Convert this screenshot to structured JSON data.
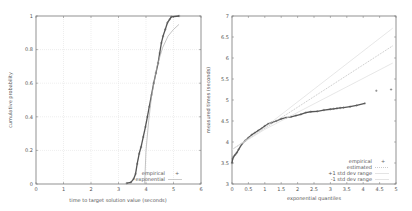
{
  "chart_data": [
    {
      "type": "line",
      "xlabel": "time to target solution value (seconds)",
      "ylabel": "cumulative probability",
      "xlim": [
        0,
        6
      ],
      "ylim": [
        0,
        1
      ],
      "xticks": [
        "0",
        "1",
        "2",
        "3",
        "4",
        "5",
        "6"
      ],
      "yticks": [
        "0",
        "0.2",
        "0.4",
        "0.6",
        "0.8",
        "1"
      ],
      "grid": true,
      "legend_position": "bottom-right",
      "series": [
        {
          "name": "empirical",
          "style": "points",
          "x": [
            3.3,
            3.45,
            3.55,
            3.62,
            3.68,
            3.75,
            3.82,
            3.9,
            3.98,
            4.05,
            4.12,
            4.2,
            4.28,
            4.36,
            4.44,
            4.5,
            4.56,
            4.62,
            4.7,
            4.78,
            4.86,
            4.92,
            5.2
          ],
          "y": [
            0.005,
            0.01,
            0.03,
            0.06,
            0.12,
            0.18,
            0.22,
            0.28,
            0.34,
            0.4,
            0.46,
            0.53,
            0.6,
            0.66,
            0.72,
            0.78,
            0.84,
            0.88,
            0.92,
            0.96,
            0.98,
            0.995,
            1.0
          ]
        },
        {
          "name": "exponential",
          "style": "line",
          "x": [
            3.95,
            4.0,
            4.1,
            4.2,
            4.4,
            4.6,
            4.8,
            5.0,
            5.2
          ],
          "y": [
            0.0,
            0.2,
            0.38,
            0.52,
            0.7,
            0.81,
            0.88,
            0.92,
            0.95
          ]
        }
      ]
    },
    {
      "type": "scatter",
      "xlabel": "exponential quantiles",
      "ylabel": "measured times (seconds)",
      "xlim": [
        0,
        5
      ],
      "ylim": [
        3,
        7
      ],
      "xticks": [
        "0",
        "0.5",
        "1",
        "1.5",
        "2",
        "2.5",
        "3",
        "3.5",
        "4",
        "4.5",
        "5"
      ],
      "yticks": [
        "3",
        "3.5",
        "4",
        "4.5",
        "5",
        "5.5",
        "6",
        "6.5",
        "7"
      ],
      "grid": false,
      "legend_position": "bottom-right",
      "series": [
        {
          "name": "empirical",
          "style": "points",
          "x": [
            0.0,
            0.02,
            0.05,
            0.1,
            0.15,
            0.2,
            0.3,
            0.4,
            0.5,
            0.6,
            0.7,
            0.8,
            0.9,
            1.0,
            1.1,
            1.2,
            1.35,
            1.5,
            1.65,
            1.8,
            1.95,
            2.1,
            2.25,
            2.4,
            2.6,
            2.8,
            3.0,
            3.1,
            3.2,
            3.3,
            3.4,
            3.6,
            3.8,
            4.05,
            4.4,
            4.85
          ],
          "y": [
            3.5,
            3.6,
            3.65,
            3.7,
            3.75,
            3.82,
            3.95,
            4.03,
            4.1,
            4.17,
            4.22,
            4.27,
            4.32,
            4.38,
            4.43,
            4.46,
            4.5,
            4.55,
            4.58,
            4.6,
            4.63,
            4.66,
            4.7,
            4.72,
            4.73,
            4.76,
            4.78,
            4.79,
            4.8,
            4.81,
            4.82,
            4.84,
            4.87,
            4.92,
            5.22,
            5.25
          ]
        },
        {
          "name": "estimated",
          "style": "line",
          "x": [
            0,
            4.9
          ],
          "y": [
            3.82,
            6.29
          ]
        },
        {
          "name": "+1 std dev range",
          "style": "line",
          "x": [
            0,
            1.0,
            4.9
          ],
          "y": [
            3.82,
            4.35,
            6.71
          ]
        },
        {
          "name": "-1 std dev range",
          "style": "line",
          "x": [
            0,
            1.0,
            4.9
          ],
          "y": [
            3.82,
            4.3,
            5.88
          ]
        }
      ]
    }
  ]
}
